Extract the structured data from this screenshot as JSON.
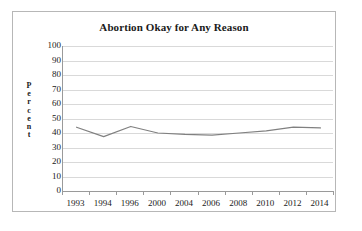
{
  "chart_data": {
    "type": "line",
    "title": "Abortion Okay for Any Reason",
    "xlabel": "",
    "ylabel": "Percent",
    "categories": [
      "1993",
      "1994",
      "1996",
      "2000",
      "2004",
      "2006",
      "2008",
      "2010",
      "2012",
      "2014"
    ],
    "values": [
      44,
      37.5,
      44.5,
      40,
      39,
      38.5,
      40,
      41.5,
      44,
      43.5
    ],
    "series": [
      {
        "name": "Abortion Okay for Any Reason",
        "values": [
          44,
          37.5,
          44.5,
          40,
          39,
          38.5,
          40,
          41.5,
          44,
          43.5
        ]
      }
    ],
    "ylim": [
      0,
      100
    ],
    "yticks": [
      "100",
      "90",
      "80",
      "70",
      "60",
      "50",
      "40",
      "30",
      "20",
      "10",
      "0"
    ],
    "ytick_values": [
      100,
      90,
      80,
      70,
      60,
      50,
      40,
      30,
      20,
      10,
      0
    ],
    "grid": true,
    "gridlines": "horizontal",
    "legend": "none",
    "line_color": "#808080",
    "gridline_color": "#d9d9d9",
    "axis_color": "#9a9a9a",
    "border_color": "#b7b7b7",
    "plot_background": "#ffffff",
    "annotations": []
  },
  "y_axis_title_letters": [
    "P",
    "e",
    "r",
    "c",
    "e",
    "n",
    "t"
  ]
}
